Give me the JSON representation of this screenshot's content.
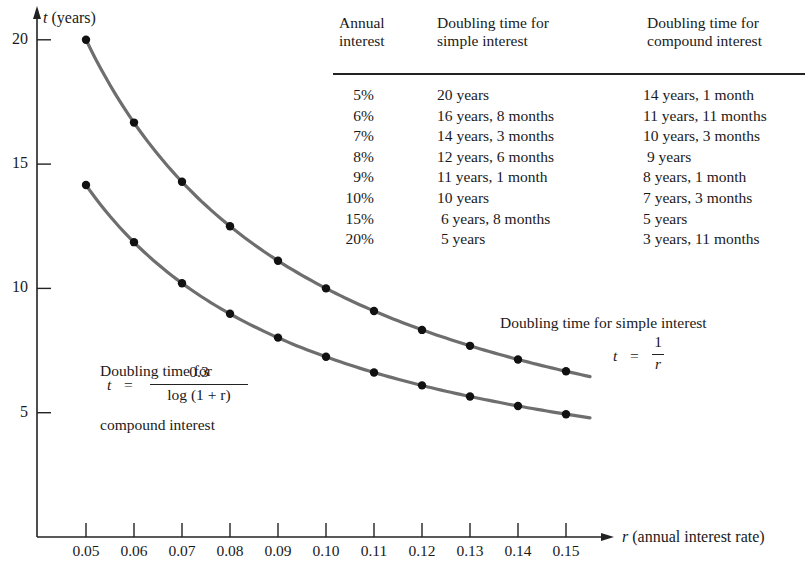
{
  "chart_data": {
    "type": "line",
    "title": "",
    "xlabel": "r (annual interest rate)",
    "ylabel": "t (years)",
    "x": [
      0.05,
      0.06,
      0.07,
      0.08,
      0.09,
      0.1,
      0.11,
      0.12,
      0.13,
      0.14,
      0.15
    ],
    "x_ticks": [
      "0.05",
      "0.06",
      "0.07",
      "0.08",
      "0.09",
      "0.10",
      "0.11",
      "0.12",
      "0.13",
      "0.14",
      "0.15"
    ],
    "y_ticks": [
      "5",
      "10",
      "15",
      "20"
    ],
    "xlim": [
      0.04,
      0.155
    ],
    "ylim": [
      0,
      21
    ],
    "grid": false,
    "series": [
      {
        "name": "Doubling time for simple interest",
        "formula": "t = 1/r",
        "values": [
          20.0,
          16.67,
          14.29,
          12.5,
          11.11,
          10.0,
          9.09,
          8.33,
          7.69,
          7.14,
          6.67
        ]
      },
      {
        "name": "Doubling time for compound interest",
        "formula": "t = 0.3/log(1 + r)",
        "values": [
          14.16,
          11.86,
          10.21,
          8.98,
          8.02,
          7.25,
          6.62,
          6.1,
          5.65,
          5.27,
          4.94
        ]
      }
    ],
    "annotations": [
      "Doubling time for simple interest",
      "t = 1/r",
      "Doubling time for compound interest",
      "t = 0.3 / log (1 + r)"
    ],
    "table": {
      "headers": [
        [
          "Annual",
          "interest"
        ],
        [
          "Doubling time for",
          "simple interest"
        ],
        [
          "Doubling time for",
          "compound interest"
        ]
      ],
      "rows": [
        [
          "5%",
          "20 years",
          "14 years, 1 month"
        ],
        [
          "6%",
          "16 years, 8 months",
          "11 years, 11 months"
        ],
        [
          "7%",
          "14 years, 3 months",
          "10 years, 3 months"
        ],
        [
          "8%",
          "12 years, 6 months",
          " 9 years"
        ],
        [
          "9%",
          "11 years, 1 month",
          "8 years, 1 month"
        ],
        [
          "10%",
          "10 years",
          "7 years, 3 months"
        ],
        [
          "15%",
          " 6 years, 8 months",
          "5 years"
        ],
        [
          "20%",
          " 5 years",
          "3 years, 11 months"
        ]
      ]
    }
  },
  "labels": {
    "y_axis_title": "t (years)",
    "y_axis_var": "t",
    "y_axis_unit": " (years)",
    "x_axis_var": "r",
    "x_axis_unit": " (annual interest rate)",
    "simple_caption": "Doubling time for simple interest",
    "simple_eq_lhs": "t",
    "simple_eq_equals": "=",
    "simple_eq_num": "1",
    "simple_eq_den": "r",
    "compound_caption_1": "Doubling time for",
    "compound_caption_2": "compound interest",
    "compound_eq_lhs": "t",
    "compound_eq_equals": "=",
    "compound_eq_num": "0.3",
    "compound_eq_den": "log (1 + r)"
  },
  "colors": {
    "curve": "#6e6e6e",
    "point": "#111111",
    "axis": "#222222"
  }
}
